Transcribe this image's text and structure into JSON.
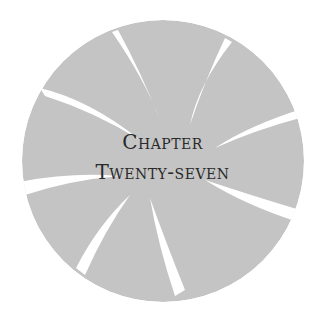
{
  "heading": {
    "line1": "Chapter",
    "line2": "Twenty-seven"
  },
  "emblem": {
    "shape": "swirl-circle",
    "fill_color": "#c4c4c4",
    "slash_color": "#ffffff",
    "background": "#ffffff"
  }
}
